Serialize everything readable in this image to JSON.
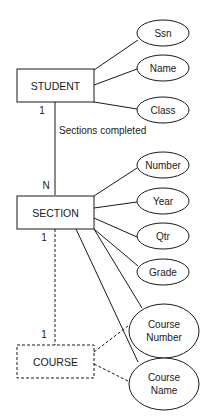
{
  "diagram": {
    "type": "ER diagram",
    "entities": {
      "student": {
        "label": "STUDENT",
        "style": "solid"
      },
      "section": {
        "label": "SECTION",
        "style": "solid"
      },
      "course": {
        "label": "COURSE",
        "style": "dashed"
      }
    },
    "attributes": {
      "ssn": "Ssn",
      "name": "Name",
      "class": "Class",
      "number": "Number",
      "year": "Year",
      "qtr": "Qtr",
      "grade": "Grade",
      "course_number_line1": "Course",
      "course_number_line2": "Number",
      "course_name_line1": "Course",
      "course_name_line2": "Name"
    },
    "relationships": {
      "sections_completed": {
        "label": "Sections completed",
        "from": "STUDENT",
        "to": "SECTION",
        "card_from": "1",
        "card_to": "N"
      },
      "section_course": {
        "from": "SECTION",
        "to": "COURSE",
        "style": "dashed",
        "card_from": "1",
        "card_to": "1"
      }
    },
    "footer_text": "(clipped caption)"
  }
}
